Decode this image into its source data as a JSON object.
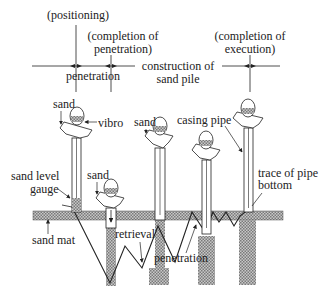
{
  "timeline": {
    "stages": [
      {
        "label_line1": "(positioning)",
        "label_line2": ""
      },
      {
        "label_line1": "(completion of",
        "label_line2": "penetration)"
      },
      {
        "label_line1": "(completion of",
        "label_line2": "execution)"
      }
    ],
    "phases": [
      {
        "label_line1": "penetration",
        "label_line2": ""
      },
      {
        "label_line1": "construction of",
        "label_line2": "sand pile"
      }
    ]
  },
  "labels": {
    "sand_1": "sand",
    "vibro": "vibro",
    "sand_level_gauge_1": "sand level",
    "sand_level_gauge_2": "gauge",
    "sand_2": "sand",
    "sand_3": "sand",
    "casing_pipe": "casing pipe",
    "trace_1": "trace of pipe",
    "trace_2": "bottom",
    "sand_mat": "sand mat",
    "retrieval": "retrieval",
    "penetration": "penetration"
  },
  "colors": {
    "line": "#222222",
    "hatch_fill": "#9a9a9a",
    "background": "#ffffff"
  }
}
